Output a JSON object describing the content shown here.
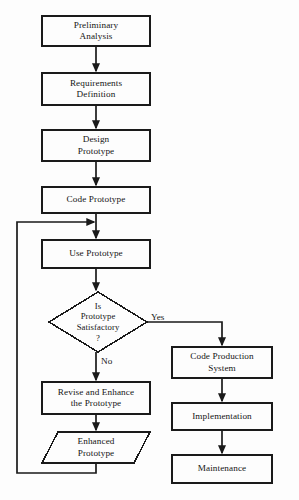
{
  "diagram": {
    "background_color": "#fdfdfd",
    "stroke_color": "#1a1a1a",
    "text_color": "#151515",
    "nodes": [
      {
        "id": "preliminary-analysis",
        "shape": "process",
        "lines": [
          "Preliminary",
          "Analysis"
        ],
        "x": 42,
        "y": 16,
        "w": 108,
        "h": 30
      },
      {
        "id": "requirements-definition",
        "shape": "process",
        "lines": [
          "Requirements",
          "Definition"
        ],
        "x": 42,
        "y": 73,
        "w": 108,
        "h": 32
      },
      {
        "id": "design-prototype",
        "shape": "process",
        "lines": [
          "Design",
          "Prototype"
        ],
        "x": 42,
        "y": 130,
        "w": 108,
        "h": 31
      },
      {
        "id": "code-prototype",
        "shape": "process",
        "lines": [
          "Code Prototype"
        ],
        "x": 42,
        "y": 187,
        "w": 108,
        "h": 26
      },
      {
        "id": "use-prototype",
        "shape": "process",
        "lines": [
          "Use Prototype"
        ],
        "x": 42,
        "y": 240,
        "w": 108,
        "h": 28
      },
      {
        "id": "is-prototype-satisfactory",
        "shape": "decision",
        "lines": [
          "Is",
          "Prototype",
          "Satisfactory",
          "?"
        ],
        "x": 49,
        "y": 292,
        "w": 98,
        "h": 60
      },
      {
        "id": "revise-and-enhance",
        "shape": "process",
        "lines": [
          "Revise and Enhance",
          "the Prototype"
        ],
        "x": 42,
        "y": 382,
        "w": 108,
        "h": 32
      },
      {
        "id": "enhanced-prototype",
        "shape": "data",
        "lines": [
          "Enhanced",
          "Prototype"
        ],
        "x": 42,
        "y": 432,
        "w": 108,
        "h": 31
      },
      {
        "id": "code-production-system",
        "shape": "process",
        "lines": [
          "Code Production",
          "System"
        ],
        "x": 172,
        "y": 347,
        "w": 100,
        "h": 31
      },
      {
        "id": "implementation",
        "shape": "process",
        "lines": [
          "Implementation"
        ],
        "x": 172,
        "y": 403,
        "w": 100,
        "h": 27
      },
      {
        "id": "maintenance",
        "shape": "process",
        "lines": [
          "Maintenance"
        ],
        "x": 172,
        "y": 455,
        "w": 100,
        "h": 28
      }
    ],
    "edge_labels": [
      {
        "id": "yes-label",
        "text": "Yes",
        "x": 151,
        "y": 312
      },
      {
        "id": "no-label",
        "text": "No",
        "x": 101,
        "y": 361
      }
    ],
    "edges": [
      {
        "id": "edge-preliminary-to-requirements",
        "from": "preliminary-analysis",
        "to": "requirements-definition"
      },
      {
        "id": "edge-requirements-to-design",
        "from": "requirements-definition",
        "to": "design-prototype"
      },
      {
        "id": "edge-design-to-code",
        "from": "design-prototype",
        "to": "code-prototype"
      },
      {
        "id": "edge-code-to-use",
        "from": "code-prototype",
        "to": "use-prototype"
      },
      {
        "id": "edge-use-to-decision",
        "from": "use-prototype",
        "to": "is-prototype-satisfactory"
      },
      {
        "id": "edge-decision-no-to-revise",
        "from": "is-prototype-satisfactory",
        "to": "revise-and-enhance",
        "label": "No"
      },
      {
        "id": "edge-revise-to-enhanced",
        "from": "revise-and-enhance",
        "to": "enhanced-prototype"
      },
      {
        "id": "edge-enhanced-feedback-to-use",
        "from": "enhanced-prototype",
        "to": "use-prototype"
      },
      {
        "id": "edge-decision-yes-to-production",
        "from": "is-prototype-satisfactory",
        "to": "code-production-system",
        "label": "Yes"
      },
      {
        "id": "edge-production-to-implementation",
        "from": "code-production-system",
        "to": "implementation"
      },
      {
        "id": "edge-implementation-to-maintenance",
        "from": "implementation",
        "to": "maintenance"
      }
    ]
  }
}
